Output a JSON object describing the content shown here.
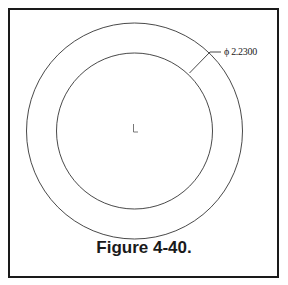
{
  "figure": {
    "caption": "Figure 4-40.",
    "dimension_label": "ϕ 2.2300",
    "dimension_symbol": "diameter",
    "dimension_value": "2.2300"
  },
  "colors": {
    "line": "#1a1a1a",
    "background": "#ffffff"
  }
}
